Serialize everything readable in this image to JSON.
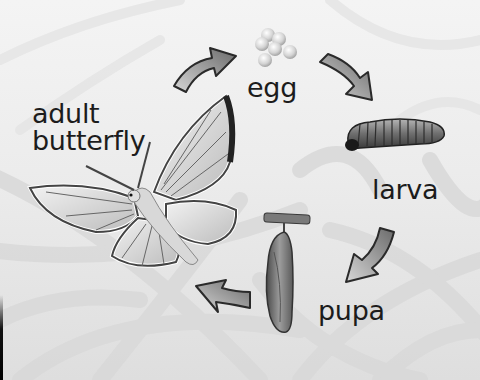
{
  "diagram": {
    "type": "cycle",
    "stages": [
      {
        "id": "egg",
        "label": "egg",
        "icon": "egg-cluster-icon"
      },
      {
        "id": "larva",
        "label": "larva",
        "icon": "caterpillar-icon"
      },
      {
        "id": "pupa",
        "label": "pupa",
        "icon": "chrysalis-icon"
      },
      {
        "id": "adult",
        "label": "adult butterfly",
        "label_lines": [
          "adult",
          "butterfly"
        ],
        "icon": "butterfly-icon"
      }
    ],
    "arrows": [
      {
        "from": "adult",
        "to": "egg",
        "icon": "curved-arrow-icon"
      },
      {
        "from": "egg",
        "to": "larva",
        "icon": "curved-arrow-icon"
      },
      {
        "from": "larva",
        "to": "pupa",
        "icon": "curved-arrow-icon"
      },
      {
        "from": "pupa",
        "to": "adult",
        "icon": "curved-arrow-icon"
      }
    ],
    "colors": {
      "background": "#ececec",
      "pattern": "#d6d6d6",
      "text": "#1c1c1c",
      "arrow_fill": "#8a8a8a",
      "arrow_outline": "#2a2a2a"
    }
  }
}
